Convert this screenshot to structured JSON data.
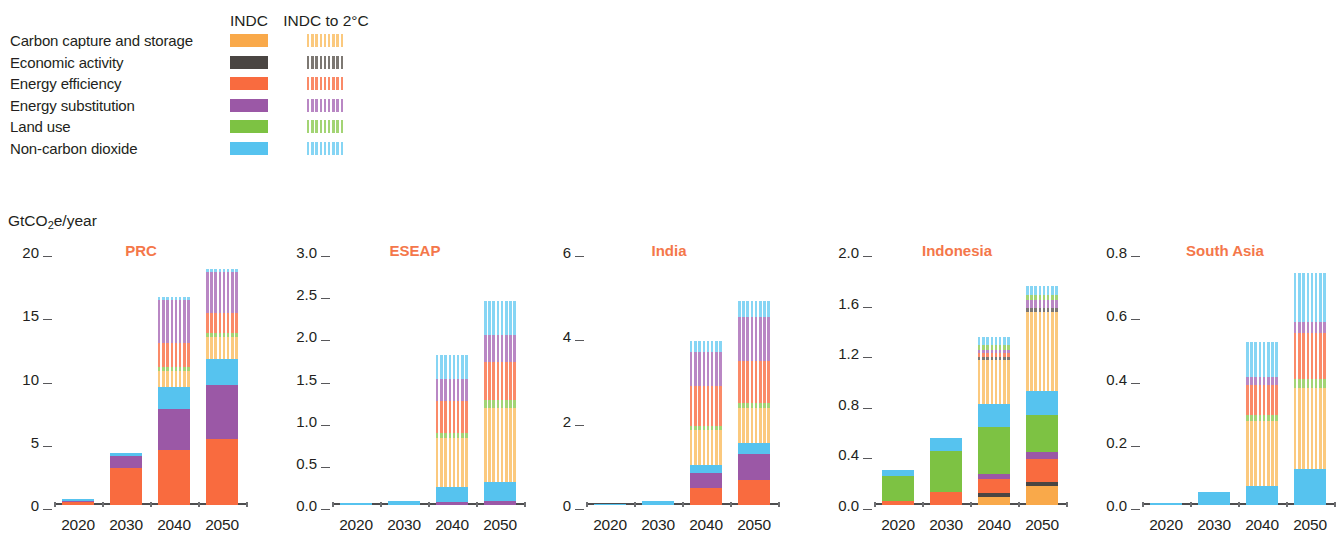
{
  "legend": {
    "columns": [
      "INDC",
      "INDC to 2°C"
    ],
    "items": [
      {
        "label": "Carbon capture and storage",
        "color": "#f9a94a",
        "key": "ccs"
      },
      {
        "label": "Economic activity",
        "color": "#4a4542",
        "key": "econ"
      },
      {
        "label": "Energy efficiency",
        "color": "#f96b3f",
        "key": "eff"
      },
      {
        "label": "Energy substitution",
        "color": "#9b58a6",
        "key": "sub"
      },
      {
        "label": "Land use",
        "color": "#7dc243",
        "key": "land"
      },
      {
        "label": "Non-carbon dioxide",
        "color": "#56c3ef",
        "key": "nco2"
      }
    ],
    "striped_colors": {
      "ccs": "#fbc97e",
      "econ": "#7d7873",
      "eff": "#fa8a68",
      "sub": "#b987c4",
      "land": "#a3d474",
      "nco2": "#86d5f4"
    }
  },
  "unit_label_pre": "GtCO",
  "unit_label_sub": "2",
  "unit_label_post": "e/year",
  "chart_data": {
    "type": "bar",
    "title": "",
    "subtype": "stacked-bar-small-multiples",
    "ylabel": "GtCO2e/year",
    "xlabel": "",
    "grid": false,
    "legend_position": "top-left",
    "categories": [
      "2020",
      "2030",
      "2040",
      "2050"
    ],
    "series_names": [
      "Carbon capture and storage",
      "Economic activity",
      "Energy efficiency",
      "Energy substitution",
      "Land use",
      "Non-carbon dioxide"
    ],
    "scenarios": [
      "INDC",
      "INDC to 2°C"
    ],
    "panels": [
      {
        "name": "PRC",
        "ylim": [
          0,
          20
        ],
        "yticks": [
          0,
          5,
          10,
          15,
          20
        ],
        "ytick_labels": [
          "0",
          "5",
          "10",
          "15",
          "20"
        ],
        "bars": [
          {
            "year": "2020",
            "total": 0.45,
            "stack": [
              {
                "key": "eff",
                "scen": "INDC",
                "value": 0.22
              },
              {
                "key": "sub",
                "scen": "INDC",
                "value": 0.13
              },
              {
                "key": "nco2",
                "scen": "INDC",
                "value": 0.1
              }
            ]
          },
          {
            "year": "2030",
            "total": 4.15,
            "stack": [
              {
                "key": "eff",
                "scen": "INDC",
                "value": 2.95
              },
              {
                "key": "sub",
                "scen": "INDC",
                "value": 0.95
              },
              {
                "key": "nco2",
                "scen": "INDC",
                "value": 0.25
              }
            ]
          },
          {
            "year": "2040",
            "total": 16.45,
            "stack": [
              {
                "key": "eff",
                "scen": "INDC",
                "value": 4.35
              },
              {
                "key": "sub",
                "scen": "INDC",
                "value": 3.25
              },
              {
                "key": "nco2",
                "scen": "INDC",
                "value": 1.7
              },
              {
                "key": "ccs",
                "scen": "INDC to 2°C",
                "value": 1.3
              },
              {
                "key": "land",
                "scen": "INDC to 2°C",
                "value": 0.35
              },
              {
                "key": "eff",
                "scen": "INDC to 2°C",
                "value": 1.85
              },
              {
                "key": "sub",
                "scen": "INDC to 2°C",
                "value": 3.4
              },
              {
                "key": "nco2",
                "scen": "INDC to 2°C",
                "value": 0.25
              }
            ]
          },
          {
            "year": "2050",
            "total": 18.7,
            "stack": [
              {
                "key": "eff",
                "scen": "INDC",
                "value": 5.25
              },
              {
                "key": "sub",
                "scen": "INDC",
                "value": 4.25
              },
              {
                "key": "nco2",
                "scen": "INDC",
                "value": 2.05
              },
              {
                "key": "ccs",
                "scen": "INDC to 2°C",
                "value": 1.75
              },
              {
                "key": "land",
                "scen": "INDC to 2°C",
                "value": 0.3
              },
              {
                "key": "eff",
                "scen": "INDC to 2°C",
                "value": 1.55
              },
              {
                "key": "sub",
                "scen": "INDC to 2°C",
                "value": 3.25
              },
              {
                "key": "nco2",
                "scen": "INDC to 2°C",
                "value": 0.3
              }
            ]
          }
        ]
      },
      {
        "name": "ESEAP",
        "ylim": [
          0,
          3.0
        ],
        "yticks": [
          0,
          0.5,
          1.0,
          1.5,
          2.0,
          2.5,
          3.0
        ],
        "ytick_labels": [
          "0.0",
          "0.5",
          "1.0",
          "1.5",
          "2.0",
          "2.5",
          "3.0"
        ],
        "bars": [
          {
            "year": "2020",
            "total": 0.02,
            "stack": [
              {
                "key": "nco2",
                "scen": "INDC",
                "value": 0.02
              }
            ]
          },
          {
            "year": "2030",
            "total": 0.05,
            "stack": [
              {
                "key": "nco2",
                "scen": "INDC",
                "value": 0.05
              }
            ]
          },
          {
            "year": "2040",
            "total": 1.78,
            "stack": [
              {
                "key": "sub",
                "scen": "INDC",
                "value": 0.04
              },
              {
                "key": "nco2",
                "scen": "INDC",
                "value": 0.17
              },
              {
                "key": "ccs",
                "scen": "INDC to 2°C",
                "value": 0.58
              },
              {
                "key": "land",
                "scen": "INDC to 2°C",
                "value": 0.06
              },
              {
                "key": "eff",
                "scen": "INDC to 2°C",
                "value": 0.38
              },
              {
                "key": "sub",
                "scen": "INDC to 2°C",
                "value": 0.27
              },
              {
                "key": "nco2",
                "scen": "INDC to 2°C",
                "value": 0.28
              }
            ]
          },
          {
            "year": "2050",
            "total": 2.42,
            "stack": [
              {
                "key": "sub",
                "scen": "INDC",
                "value": 0.05
              },
              {
                "key": "nco2",
                "scen": "INDC",
                "value": 0.22
              },
              {
                "key": "ccs",
                "scen": "INDC to 2°C",
                "value": 0.88
              },
              {
                "key": "land",
                "scen": "INDC to 2°C",
                "value": 0.09
              },
              {
                "key": "eff",
                "scen": "INDC to 2°C",
                "value": 0.46
              },
              {
                "key": "sub",
                "scen": "INDC to 2°C",
                "value": 0.32
              },
              {
                "key": "nco2",
                "scen": "INDC to 2°C",
                "value": 0.4
              }
            ]
          }
        ]
      },
      {
        "name": "India",
        "ylim": [
          0,
          6
        ],
        "yticks": [
          0,
          2,
          4,
          6
        ],
        "ytick_labels": [
          "0",
          "2",
          "4",
          "6"
        ],
        "bars": [
          {
            "year": "2020",
            "total": 0.02,
            "stack": [
              {
                "key": "nco2",
                "scen": "INDC",
                "value": 0.02
              }
            ]
          },
          {
            "year": "2030",
            "total": 0.1,
            "stack": [
              {
                "key": "nco2",
                "scen": "INDC",
                "value": 0.1
              }
            ]
          },
          {
            "year": "2040",
            "total": 3.88,
            "stack": [
              {
                "key": "eff",
                "scen": "INDC",
                "value": 0.4
              },
              {
                "key": "sub",
                "scen": "INDC",
                "value": 0.36
              },
              {
                "key": "nco2",
                "scen": "INDC",
                "value": 0.2
              },
              {
                "key": "ccs",
                "scen": "INDC to 2°C",
                "value": 0.82
              },
              {
                "key": "land",
                "scen": "INDC to 2°C",
                "value": 0.1
              },
              {
                "key": "eff",
                "scen": "INDC to 2°C",
                "value": 0.95
              },
              {
                "key": "sub",
                "scen": "INDC to 2°C",
                "value": 0.8
              },
              {
                "key": "nco2",
                "scen": "INDC to 2°C",
                "value": 0.25
              }
            ]
          },
          {
            "year": "2050",
            "total": 4.85,
            "stack": [
              {
                "key": "eff",
                "scen": "INDC",
                "value": 0.6
              },
              {
                "key": "sub",
                "scen": "INDC",
                "value": 0.62
              },
              {
                "key": "nco2",
                "scen": "INDC",
                "value": 0.25
              },
              {
                "key": "ccs",
                "scen": "INDC to 2°C",
                "value": 0.82
              },
              {
                "key": "land",
                "scen": "INDC to 2°C",
                "value": 0.12
              },
              {
                "key": "eff",
                "scen": "INDC to 2°C",
                "value": 1.0
              },
              {
                "key": "sub",
                "scen": "INDC to 2°C",
                "value": 1.06
              },
              {
                "key": "nco2",
                "scen": "INDC to 2°C",
                "value": 0.38
              }
            ]
          }
        ]
      },
      {
        "name": "Indonesia",
        "ylim": [
          0,
          2.0
        ],
        "yticks": [
          0,
          0.4,
          0.8,
          1.2,
          1.6,
          2.0
        ],
        "ytick_labels": [
          "0.0",
          "0.4",
          "0.8",
          "1.2",
          "1.6",
          "2.0"
        ],
        "bars": [
          {
            "year": "2020",
            "total": 0.28,
            "stack": [
              {
                "key": "eff",
                "scen": "INDC",
                "value": 0.035
              },
              {
                "key": "land",
                "scen": "INDC",
                "value": 0.195
              },
              {
                "key": "nco2",
                "scen": "INDC",
                "value": 0.05
              }
            ]
          },
          {
            "year": "2030",
            "total": 0.53,
            "stack": [
              {
                "key": "eff",
                "scen": "INDC",
                "value": 0.105
              },
              {
                "key": "land",
                "scen": "INDC",
                "value": 0.325
              },
              {
                "key": "nco2",
                "scen": "INDC",
                "value": 0.1
              }
            ]
          },
          {
            "year": "2040",
            "total": 1.33,
            "stack": [
              {
                "key": "ccs",
                "scen": "INDC",
                "value": 0.065
              },
              {
                "key": "econ",
                "scen": "INDC",
                "value": 0.03
              },
              {
                "key": "eff",
                "scen": "INDC",
                "value": 0.11
              },
              {
                "key": "sub",
                "scen": "INDC",
                "value": 0.04
              },
              {
                "key": "land",
                "scen": "INDC",
                "value": 0.375
              },
              {
                "key": "nco2",
                "scen": "INDC",
                "value": 0.18
              },
              {
                "key": "ccs",
                "scen": "INDC to 2°C",
                "value": 0.345
              },
              {
                "key": "econ",
                "scen": "INDC to 2°C",
                "value": 0.025
              },
              {
                "key": "eff",
                "scen": "INDC to 2°C",
                "value": 0.035
              },
              {
                "key": "sub",
                "scen": "INDC to 2°C",
                "value": 0.02
              },
              {
                "key": "land",
                "scen": "INDC to 2°C",
                "value": 0.04
              },
              {
                "key": "nco2",
                "scen": "INDC to 2°C",
                "value": 0.065
              }
            ]
          },
          {
            "year": "2050",
            "total": 1.73,
            "stack": [
              {
                "key": "ccs",
                "scen": "INDC",
                "value": 0.15
              },
              {
                "key": "econ",
                "scen": "INDC",
                "value": 0.035
              },
              {
                "key": "eff",
                "scen": "INDC",
                "value": 0.175
              },
              {
                "key": "sub",
                "scen": "INDC",
                "value": 0.06
              },
              {
                "key": "land",
                "scen": "INDC",
                "value": 0.29
              },
              {
                "key": "nco2",
                "scen": "INDC",
                "value": 0.195
              },
              {
                "key": "ccs",
                "scen": "INDC to 2°C",
                "value": 0.62
              },
              {
                "key": "econ",
                "scen": "INDC to 2°C",
                "value": 0.035
              },
              {
                "key": "sub",
                "scen": "INDC to 2°C",
                "value": 0.06
              },
              {
                "key": "land",
                "scen": "INDC to 2°C",
                "value": 0.04
              },
              {
                "key": "nco2",
                "scen": "INDC to 2°C",
                "value": 0.07
              }
            ]
          }
        ]
      },
      {
        "name": "South Asia",
        "ylim": [
          0,
          0.8
        ],
        "yticks": [
          0,
          0.2,
          0.4,
          0.6,
          0.8
        ],
        "ytick_labels": [
          "0.0",
          "0.2",
          "0.4",
          "0.6",
          "0.8"
        ],
        "bars": [
          {
            "year": "2020",
            "total": 0.005,
            "stack": [
              {
                "key": "nco2",
                "scen": "INDC",
                "value": 0.005
              }
            ]
          },
          {
            "year": "2030",
            "total": 0.042,
            "stack": [
              {
                "key": "nco2",
                "scen": "INDC",
                "value": 0.042
              }
            ]
          },
          {
            "year": "2040",
            "total": 0.515,
            "stack": [
              {
                "key": "nco2",
                "scen": "INDC",
                "value": 0.06
              },
              {
                "key": "ccs",
                "scen": "INDC to 2°C",
                "value": 0.205
              },
              {
                "key": "land",
                "scen": "INDC to 2°C",
                "value": 0.02
              },
              {
                "key": "eff",
                "scen": "INDC to 2°C",
                "value": 0.095
              },
              {
                "key": "sub",
                "scen": "INDC to 2°C",
                "value": 0.025
              },
              {
                "key": "nco2",
                "scen": "INDC to 2°C",
                "value": 0.11
              }
            ]
          },
          {
            "year": "2050",
            "total": 0.735,
            "stack": [
              {
                "key": "nco2",
                "scen": "INDC",
                "value": 0.115
              },
              {
                "key": "ccs",
                "scen": "INDC to 2°C",
                "value": 0.255
              },
              {
                "key": "land",
                "scen": "INDC to 2°C",
                "value": 0.03
              },
              {
                "key": "eff",
                "scen": "INDC to 2°C",
                "value": 0.145
              },
              {
                "key": "sub",
                "scen": "INDC to 2°C",
                "value": 0.035
              },
              {
                "key": "nco2",
                "scen": "INDC to 2°C",
                "value": 0.155
              }
            ]
          }
        ]
      }
    ]
  },
  "panel_geometry": [
    {
      "left": 8,
      "plot_left": 46,
      "plot_width": 192,
      "title_left": 58,
      "title_width": 150
    },
    {
      "left": 276,
      "plot_left": 56,
      "plot_width": 192,
      "title_left": 64,
      "title_width": 150
    },
    {
      "left": 548,
      "plot_left": 38,
      "plot_width": 192,
      "title_left": 46,
      "title_width": 150
    },
    {
      "left": 818,
      "plot_left": 56,
      "plot_width": 192,
      "title_left": 64,
      "title_width": 150
    },
    {
      "left": 1086,
      "plot_left": 56,
      "plot_width": 192,
      "title_left": 64,
      "title_width": 150
    }
  ],
  "accent_color": "#f4774a",
  "axis_color": "#4d4d4f",
  "text_color": "#231f20"
}
